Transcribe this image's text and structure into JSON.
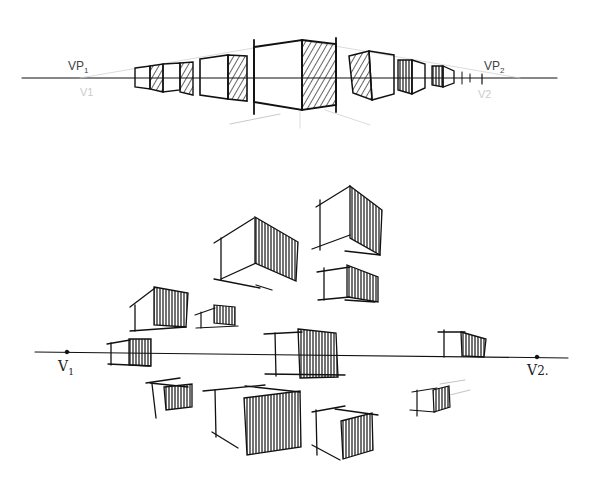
{
  "figure": {
    "top_diagram": {
      "label_left": "VP",
      "label_left_sub": "1",
      "label_right": "VP",
      "label_right_sub": "2",
      "faint_left": "V1",
      "faint_right": "V2"
    },
    "bottom_diagram": {
      "label_left": "V",
      "label_left_sub": "1",
      "label_right": "V",
      "label_right_sub": "2."
    },
    "colors": {
      "ink": "#111111",
      "paper": "#ffffff",
      "faint": "#bbbbbb"
    }
  }
}
